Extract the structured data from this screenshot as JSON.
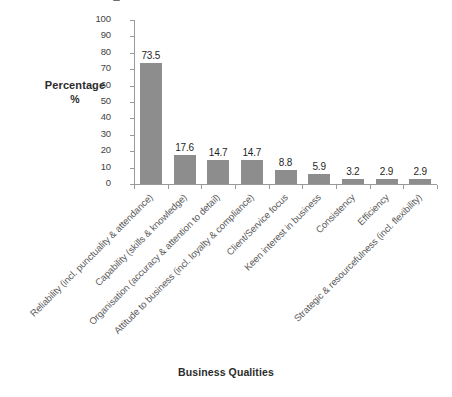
{
  "chart_data": {
    "type": "bar",
    "title": "",
    "xlabel": "Business Qualities",
    "ylabel": "Percentage %",
    "ylabel_lines": [
      "Percentage",
      "%"
    ],
    "ylim": [
      0,
      100
    ],
    "ytick_labels": [
      "100",
      "90",
      "80",
      "70",
      "60",
      "50",
      "40",
      "30",
      "20",
      "10",
      "0"
    ],
    "ytick_values": [
      100,
      90,
      80,
      70,
      60,
      50,
      40,
      30,
      20,
      10,
      0
    ],
    "grid": false,
    "legend": false,
    "bar_color": "#8d8d8d",
    "axis_color": "#9a9a9a",
    "categories": [
      "Reliability (incl. punctuality & attendance)",
      "Capability (skills & knowledge)",
      "Organisation (accuracy & attention to detail)",
      "Attitude to business (incl. loyalty & compliance)",
      "Client/Service focus",
      "Keen interest in business",
      "Consistency",
      "Efficiency",
      "Strategic & resourcefulness (incl. flexibility)"
    ],
    "values": [
      73.5,
      17.6,
      14.7,
      14.7,
      8.8,
      5.9,
      3.2,
      2.9,
      2.9
    ],
    "value_labels": [
      "73.5",
      "17.6",
      "14.7",
      "14.7",
      "8.8",
      "5.9",
      "3.2",
      "2.9",
      "2.9"
    ]
  }
}
